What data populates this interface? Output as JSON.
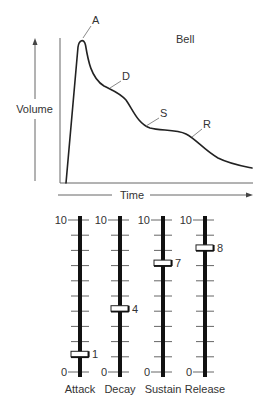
{
  "graph": {
    "title": "Bell",
    "y_axis_label": "Volume",
    "x_axis_label": "Time",
    "phase_labels": {
      "attack": "A",
      "decay": "D",
      "sustain": "S",
      "release": "R"
    }
  },
  "sliders": {
    "scale_max_label": "10",
    "scale_min_label": "0",
    "scale_max": 10,
    "scale_min": 0,
    "items": [
      {
        "name": "Attack",
        "value": 1,
        "value_label": "1"
      },
      {
        "name": "Decay",
        "value": 4,
        "value_label": "4"
      },
      {
        "name": "Sustain",
        "value": 7,
        "value_label": "7"
      },
      {
        "name": "Release",
        "value": 8,
        "value_label": "8"
      }
    ]
  },
  "colors": {
    "background": "#ffffff",
    "ink": "#222222",
    "text": "#333333",
    "guide": "#8a8a8a"
  }
}
